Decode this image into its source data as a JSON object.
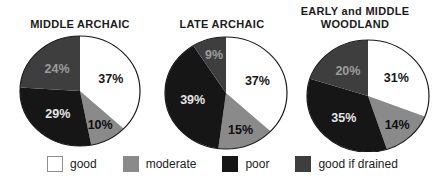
{
  "figure": {
    "background": "#ffffff"
  },
  "palette": {
    "good": "#ffffff",
    "moderate": "#8a8a8a",
    "poor": "#161616",
    "good if drained": "#3e3e3e"
  },
  "slice_label_colors": {
    "good": "#161616",
    "moderate": "#0e0e0e",
    "poor": "#e4e4e4",
    "good if drained": "#9c9c9c"
  },
  "chart_data": [
    {
      "type": "pie",
      "title": "MIDDLE ARCHAIC",
      "categories": [
        "good",
        "moderate",
        "poor",
        "good if drained"
      ],
      "values": [
        37,
        10,
        29,
        24
      ],
      "labels": [
        "37%",
        "10%",
        "29%",
        "24%"
      ],
      "unit": "percent",
      "direction": "clockwise",
      "start_angle": "top"
    },
    {
      "type": "pie",
      "title": "LATE ARCHAIC",
      "categories": [
        "good",
        "moderate",
        "poor",
        "good if drained"
      ],
      "values": [
        37,
        15,
        39,
        9
      ],
      "labels": [
        "37%",
        "15%",
        "39%",
        "9%"
      ],
      "unit": "percent",
      "direction": "clockwise",
      "start_angle": "top"
    },
    {
      "type": "pie",
      "title": "EARLY and MIDDLE WOODLAND",
      "categories": [
        "good",
        "moderate",
        "poor",
        "good if drained"
      ],
      "values": [
        31,
        14,
        35,
        20
      ],
      "labels": [
        "31%",
        "14%",
        "35%",
        "20%"
      ],
      "unit": "percent",
      "direction": "clockwise",
      "start_angle": "top"
    }
  ],
  "legend": {
    "position": "bottom",
    "items": [
      {
        "label": "good",
        "color": "#ffffff"
      },
      {
        "label": "moderate",
        "color": "#8a8a8a"
      },
      {
        "label": "poor",
        "color": "#161616"
      },
      {
        "label": "good if drained",
        "color": "#3e3e3e"
      }
    ]
  }
}
